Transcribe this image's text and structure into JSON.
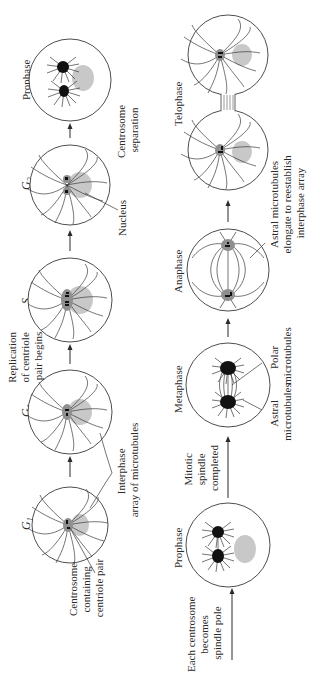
{
  "figure": {
    "orientation": "rotated 90 degrees counterclockwise",
    "background": "#ffffff",
    "colors": {
      "outline": "#3a3a3a",
      "nucleus": "#c8c8c8",
      "centrosome": "#8f8f8f",
      "spindle_pole": "#111111"
    }
  },
  "interphase_row": {
    "stages": [
      {
        "label": "G",
        "subscript": "1"
      },
      {
        "label": "G",
        "subscript": "1"
      },
      {
        "label": "S",
        "subscript": ""
      },
      {
        "label": "G",
        "subscript": "2"
      },
      {
        "label": "Prophase",
        "subscript": ""
      }
    ],
    "transitions": [
      {
        "lines": [
          "Replication",
          "of centriole",
          "pair begins"
        ]
      },
      {
        "lines": [
          "Centrosome",
          "separation"
        ]
      }
    ],
    "annotations": {
      "centrosome": [
        "Centrosome",
        "containing",
        "centriole pair"
      ],
      "interphase_array": [
        "Interphase",
        "array of microtubules"
      ],
      "nucleus": [
        "Nucleus"
      ]
    }
  },
  "mitosis_row": {
    "stages": [
      {
        "label": "Prophase"
      },
      {
        "label": "Metaphase"
      },
      {
        "label": "Anaphase"
      },
      {
        "label": "Telophase"
      }
    ],
    "transitions": [
      {
        "lines": [
          "Each centrosome",
          "becomes",
          "spindle pole"
        ]
      },
      {
        "lines": [
          "Mitotic",
          "spindle",
          "completed"
        ]
      }
    ],
    "annotations": {
      "astral": [
        "Astral",
        "microtubules"
      ],
      "polar": [
        "Polar",
        "microtubules"
      ],
      "astral_elongate": [
        "Astral microtubules",
        "elongate to reestablish",
        "interphase array"
      ]
    }
  }
}
